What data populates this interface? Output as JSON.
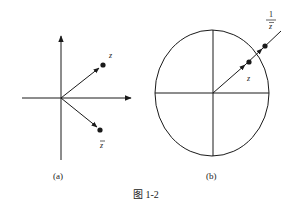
{
  "figure": {
    "caption": "图 1-2",
    "stroke_color": "#1a1a1a"
  },
  "panel_a": {
    "label": "(a)",
    "point_z_label": "z",
    "point_zbar_label": "z",
    "point_zbar_overline": true
  },
  "panel_b": {
    "label": "(b)",
    "point_z_label": "z",
    "point_inv_label_numerator": "1",
    "point_inv_label_denominator": "z",
    "point_inv_denominator_overline": true
  }
}
